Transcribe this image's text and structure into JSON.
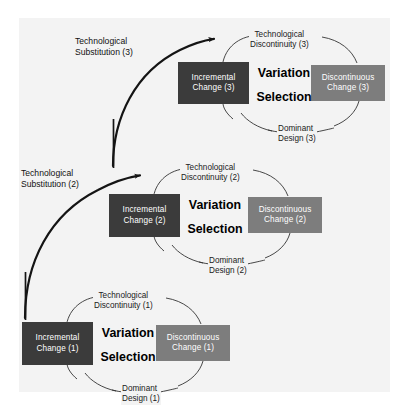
{
  "figure": {
    "background_color": "#f3f3f3",
    "page_color": "#ffffff",
    "dark_box_color": "#3b3b3b",
    "gray_box_color": "#7d7d7d",
    "line_color": "#1a1a1a"
  },
  "cycles": [
    {
      "id": "cycle-3",
      "index": "3",
      "top_label": {
        "line1": "Technological",
        "line2": "Discontinuity (3)"
      },
      "bottom_label": {
        "line1": "Dominant",
        "line2": "Design (3)"
      },
      "left_box": {
        "line1": "Incremental",
        "line2": "Change (3)"
      },
      "right_box": {
        "line1": "Discontinuous",
        "line2": "Change (3)"
      },
      "center_top": "Variation",
      "center_bottom": "Selection"
    },
    {
      "id": "cycle-2",
      "index": "2",
      "top_label": {
        "line1": "Technological",
        "line2": "Discontinuity (2)"
      },
      "bottom_label": {
        "line1": "Dominant",
        "line2": "Design (2)"
      },
      "left_box": {
        "line1": "Incremental",
        "line2": "Change (2)"
      },
      "right_box": {
        "line1": "Discontinuous",
        "line2": "Change (2)"
      },
      "center_top": "Variation",
      "center_bottom": "Selection"
    },
    {
      "id": "cycle-1",
      "index": "1",
      "top_label": {
        "line1": "Technological",
        "line2": "Discontinuity (1)"
      },
      "bottom_label": {
        "line1": "Dominant",
        "line2": "Design (1)"
      },
      "left_box": {
        "line1": "Incremental",
        "line2": "Change (1)"
      },
      "right_box": {
        "line1": "Discontinuous",
        "line2": "Change (1)"
      },
      "center_top": "Variation",
      "center_bottom": "Selection"
    }
  ],
  "substitutions": [
    {
      "id": "substitution-3",
      "line1": "Technological",
      "line2": "Substitution (3)"
    },
    {
      "id": "substitution-2",
      "line1": "Technological",
      "line2": "Substitution (2)"
    }
  ]
}
